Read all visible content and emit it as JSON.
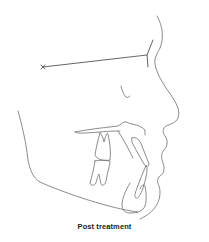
{
  "figure": {
    "caption": "Post treatment",
    "line_color": "#6e6e6e",
    "caption_color": "#222222",
    "structures": [
      "soft-tissue-profile",
      "nasion-marker",
      "sella-nasion-line",
      "orbit",
      "palatal-plane",
      "maxillary-molar",
      "mandibular-molar",
      "maxillary-incisor",
      "mandibular-incisor",
      "mandible-outline",
      "symphysis"
    ]
  }
}
